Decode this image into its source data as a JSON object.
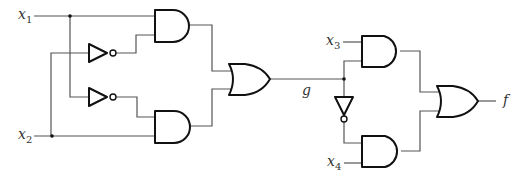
{
  "diagram": {
    "type": "logic-circuit",
    "inputs": [
      {
        "name": "x",
        "sub": "1"
      },
      {
        "name": "x",
        "sub": "2"
      },
      {
        "name": "x",
        "sub": "3"
      },
      {
        "name": "x",
        "sub": "4"
      }
    ],
    "intermediate": {
      "name": "g"
    },
    "output": {
      "name": "f"
    },
    "gates": [
      {
        "id": "and1",
        "type": "AND",
        "inputs": [
          "x1",
          "NOT x2"
        ]
      },
      {
        "id": "and2",
        "type": "AND",
        "inputs": [
          "NOT x1",
          "x2"
        ]
      },
      {
        "id": "or1",
        "type": "OR",
        "inputs": [
          "and1",
          "and2"
        ],
        "output": "g"
      },
      {
        "id": "and3",
        "type": "AND",
        "inputs": [
          "x3",
          "g"
        ]
      },
      {
        "id": "and4",
        "type": "AND",
        "inputs": [
          "NOT g",
          "x4"
        ]
      },
      {
        "id": "or2",
        "type": "OR",
        "inputs": [
          "and3",
          "and4"
        ],
        "output": "f"
      }
    ],
    "inverters": 3,
    "colors": {
      "gate_stroke": "#111111",
      "wire": "#555555",
      "background": "#ffffff"
    }
  }
}
